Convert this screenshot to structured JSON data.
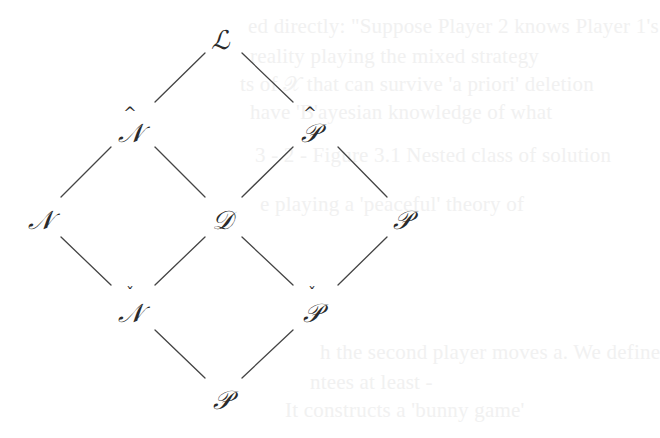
{
  "diagram": {
    "type": "lattice",
    "line_color": "#444444",
    "text_color": "#2a2a2a",
    "nodes": [
      {
        "id": "L",
        "label": "ℒ",
        "accent": "",
        "x": 220,
        "y": 40
      },
      {
        "id": "N_hat",
        "label": "𝒩",
        "accent": "^",
        "x": 130,
        "y": 130
      },
      {
        "id": "P_hat",
        "label": "𝒫",
        "accent": "^",
        "x": 310,
        "y": 130
      },
      {
        "id": "N",
        "label": "𝒩",
        "accent": "",
        "x": 40,
        "y": 220
      },
      {
        "id": "D",
        "label": "𝒟",
        "accent": "",
        "x": 220,
        "y": 220
      },
      {
        "id": "P_right",
        "label": "𝒫",
        "accent": "",
        "x": 400,
        "y": 220
      },
      {
        "id": "N_check",
        "label": "𝒩",
        "accent": "ˇ",
        "x": 130,
        "y": 310
      },
      {
        "id": "P_check",
        "label": "𝒫",
        "accent": "ˇ",
        "x": 310,
        "y": 310
      },
      {
        "id": "P_bottom",
        "label": "𝒫",
        "accent": "",
        "x": 220,
        "y": 400
      }
    ],
    "edges": [
      [
        "L",
        "N_hat"
      ],
      [
        "L",
        "P_hat"
      ],
      [
        "N_hat",
        "N"
      ],
      [
        "N_hat",
        "D"
      ],
      [
        "P_hat",
        "D"
      ],
      [
        "P_hat",
        "P_right"
      ],
      [
        "N",
        "N_check"
      ],
      [
        "D",
        "N_check"
      ],
      [
        "D",
        "P_check"
      ],
      [
        "P_right",
        "P_check"
      ],
      [
        "N_check",
        "P_bottom"
      ],
      [
        "P_check",
        "P_bottom"
      ]
    ]
  },
  "bleed_through": [
    "ed directly: \"Suppose Player 2 knows Player 1's",
    "reality playing the mixed strategy ",
    "ts of 𝒳 that can survive 'a priori' deletion",
    "have 'B'ayesian knowledge of what",
    "3 - 2 - Figure 3.1 Nested class of solution",
    "    e playing a 'peaceful' theory of",
    "",
    "h the second player moves a. We define",
    "ntees at least  -",
    "  It constructs a 'bunny game'"
  ]
}
